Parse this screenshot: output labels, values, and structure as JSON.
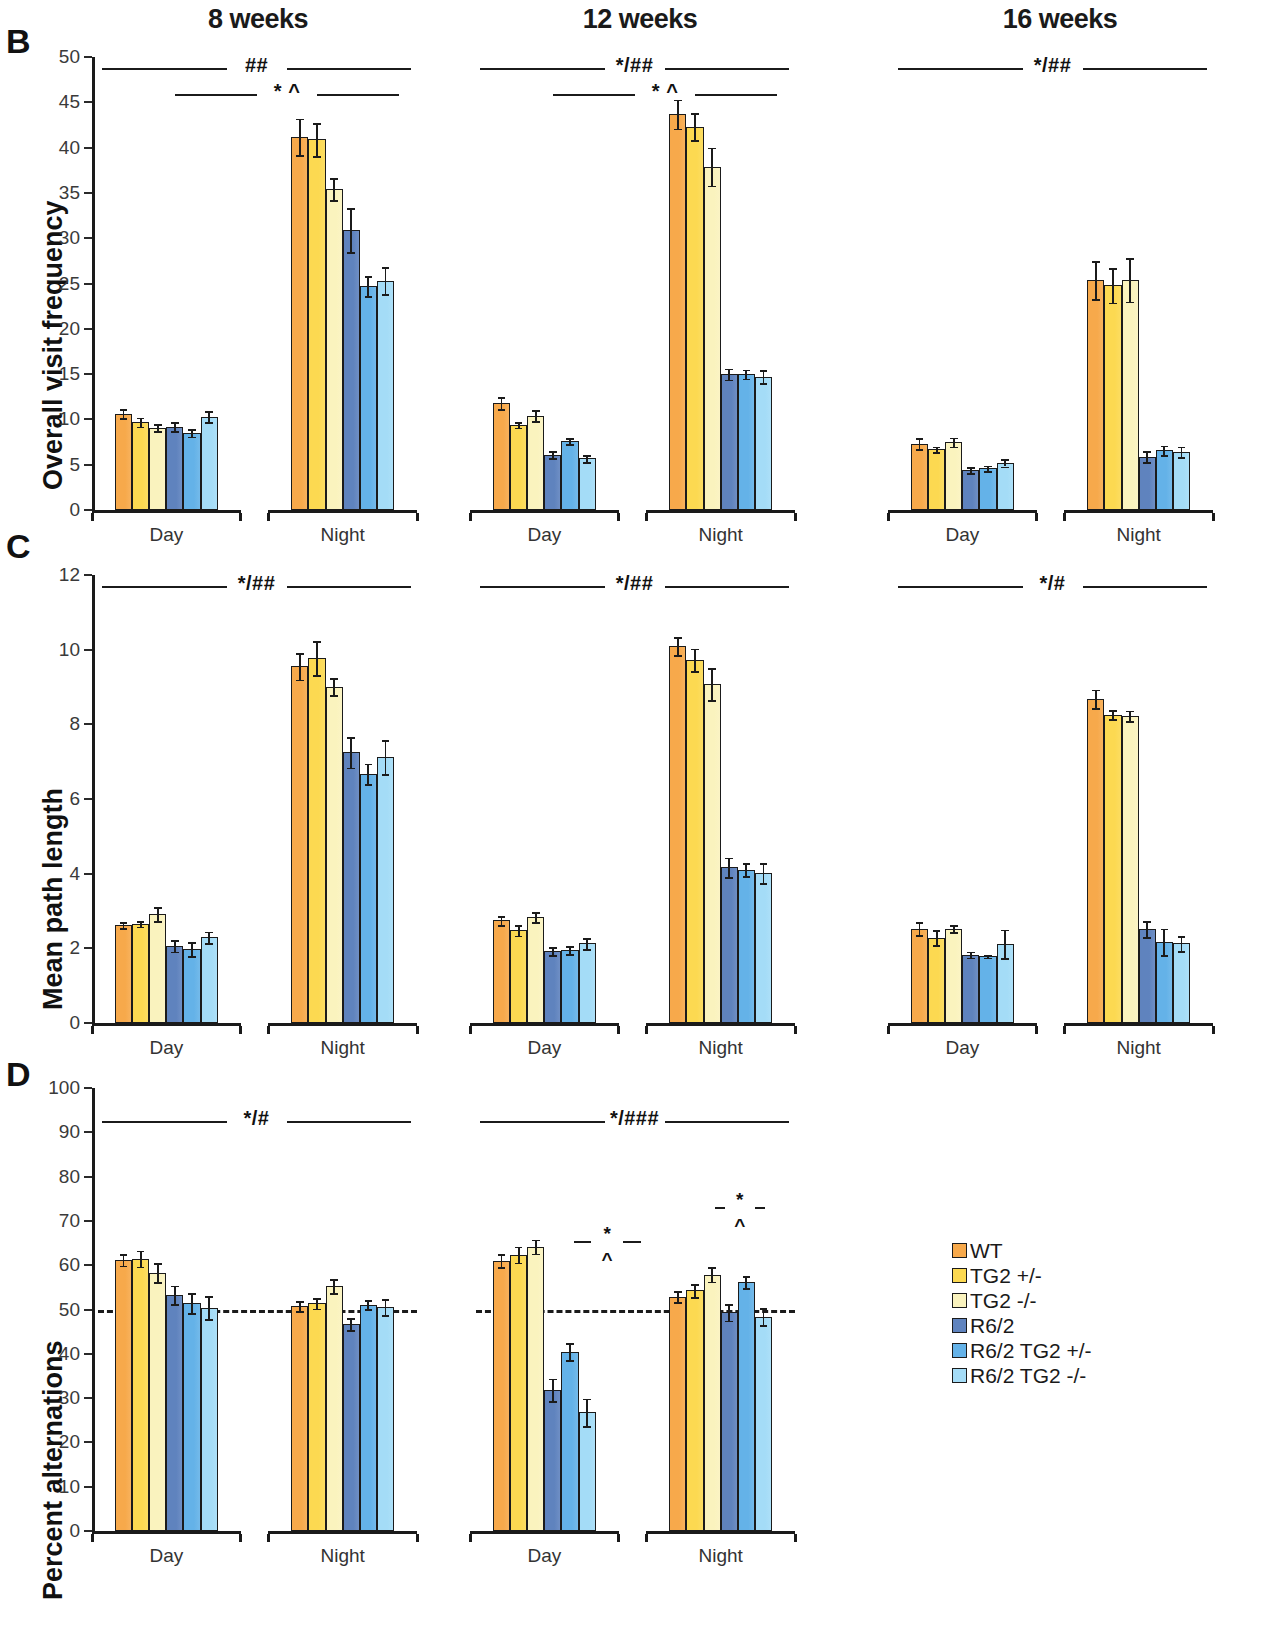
{
  "figure": {
    "column_titles": [
      "8 weeks",
      "12 weeks",
      "16 weeks"
    ],
    "panel_letters": [
      "B",
      "C",
      "D"
    ],
    "group_labels": [
      "Day",
      "Night"
    ]
  },
  "legend": {
    "position": "bottom-right",
    "entries": [
      {
        "label": "WT",
        "color": "#F7A94B"
      },
      {
        "label": "TG2 +/-",
        "color": "#FCD951"
      },
      {
        "label": "TG2 -/-",
        "color": "#FAF3BE"
      },
      {
        "label": "R6/2",
        "color": "#5F83BE"
      },
      {
        "label": "R6/2 TG2 +/-",
        "color": "#64B2E8"
      },
      {
        "label": "R6/2 TG2 -/-",
        "color": "#A4DCF7"
      }
    ]
  },
  "chart_data": [
    {
      "panel": "B",
      "type": "bar",
      "title": "8 weeks",
      "ylabel": "Overall visit frequency",
      "xlabel": "",
      "ylim": [
        0,
        50
      ],
      "yticks": [
        0,
        5,
        10,
        15,
        20,
        25,
        30,
        35,
        40,
        45,
        50
      ],
      "categories": [
        "Day",
        "Night"
      ],
      "series": [
        {
          "name": "WT",
          "values": [
            10.6,
            41.2
          ],
          "errors": [
            0.5,
            2.0
          ]
        },
        {
          "name": "TG2 +/-",
          "values": [
            9.7,
            40.9
          ],
          "errors": [
            0.5,
            1.8
          ]
        },
        {
          "name": "TG2 -/-",
          "values": [
            9.1,
            35.4
          ],
          "errors": [
            0.4,
            1.2
          ]
        },
        {
          "name": "R6/2",
          "values": [
            9.2,
            30.9
          ],
          "errors": [
            0.5,
            2.4
          ]
        },
        {
          "name": "R6/2 TG2 +/-",
          "values": [
            8.5,
            24.7
          ],
          "errors": [
            0.4,
            1.1
          ]
        },
        {
          "name": "R6/2 TG2 -/-",
          "values": [
            10.3,
            25.3
          ],
          "errors": [
            0.6,
            1.5
          ]
        }
      ],
      "annotations": [
        {
          "text": "##",
          "span": "Day-to-Night",
          "level": 1
        },
        {
          "text": "* ^",
          "span": "Night genotypes",
          "level": 2
        }
      ]
    },
    {
      "panel": "B",
      "type": "bar",
      "title": "12 weeks",
      "ylabel": "Overall visit frequency",
      "xlabel": "",
      "ylim": [
        0,
        50
      ],
      "yticks": [
        0,
        5,
        10,
        15,
        20,
        25,
        30,
        35,
        40,
        45,
        50
      ],
      "categories": [
        "Day",
        "Night"
      ],
      "series": [
        {
          "name": "WT",
          "values": [
            11.8,
            43.7
          ],
          "errors": [
            0.7,
            1.6
          ]
        },
        {
          "name": "TG2 +/-",
          "values": [
            9.4,
            42.3
          ],
          "errors": [
            0.3,
            1.5
          ]
        },
        {
          "name": "TG2 -/-",
          "values": [
            10.4,
            37.9
          ],
          "errors": [
            0.6,
            2.1
          ]
        },
        {
          "name": "R6/2",
          "values": [
            6.1,
            15.0
          ],
          "errors": [
            0.4,
            0.6
          ]
        },
        {
          "name": "R6/2 TG2 +/-",
          "values": [
            7.6,
            15.0
          ],
          "errors": [
            0.3,
            0.5
          ]
        },
        {
          "name": "R6/2 TG2 -/-",
          "values": [
            5.7,
            14.7
          ],
          "errors": [
            0.4,
            0.7
          ]
        }
      ],
      "annotations": [
        {
          "text": "*/##",
          "span": "Day-to-Night",
          "level": 1
        },
        {
          "text": "* ^",
          "span": "Night genotypes",
          "level": 2
        }
      ]
    },
    {
      "panel": "B",
      "type": "bar",
      "title": "16 weeks",
      "ylabel": "Overall visit frequency",
      "xlabel": "",
      "ylim": [
        0,
        50
      ],
      "yticks": [
        0,
        5,
        10,
        15,
        20,
        25,
        30,
        35,
        40,
        45,
        50
      ],
      "categories": [
        "Day",
        "Night"
      ],
      "series": [
        {
          "name": "WT",
          "values": [
            7.3,
            25.4
          ],
          "errors": [
            0.6,
            2.1
          ]
        },
        {
          "name": "TG2 +/-",
          "values": [
            6.7,
            24.8
          ],
          "errors": [
            0.3,
            1.9
          ]
        },
        {
          "name": "TG2 -/-",
          "values": [
            7.5,
            25.4
          ],
          "errors": [
            0.5,
            2.4
          ]
        },
        {
          "name": "R6/2",
          "values": [
            4.4,
            5.9
          ],
          "errors": [
            0.3,
            0.6
          ]
        },
        {
          "name": "R6/2 TG2 +/-",
          "values": [
            4.6,
            6.6
          ],
          "errors": [
            0.3,
            0.5
          ]
        },
        {
          "name": "R6/2 TG2 -/-",
          "values": [
            5.2,
            6.4
          ],
          "errors": [
            0.4,
            0.6
          ]
        }
      ],
      "annotations": [
        {
          "text": "*/##",
          "span": "Day-to-Night",
          "level": 1
        }
      ]
    },
    {
      "panel": "C",
      "type": "bar",
      "title": "8 weeks",
      "ylabel": "Mean path length",
      "xlabel": "",
      "ylim": [
        0,
        12
      ],
      "yticks": [
        0,
        2,
        4,
        6,
        8,
        10,
        12
      ],
      "categories": [
        "Day",
        "Night"
      ],
      "series": [
        {
          "name": "WT",
          "values": [
            2.63,
            9.55
          ],
          "errors": [
            0.08,
            0.35
          ]
        },
        {
          "name": "TG2 +/-",
          "values": [
            2.66,
            9.77
          ],
          "errors": [
            0.08,
            0.45
          ]
        },
        {
          "name": "TG2 -/-",
          "values": [
            2.92,
            9.01
          ],
          "errors": [
            0.19,
            0.22
          ]
        },
        {
          "name": "R6/2",
          "values": [
            2.06,
            7.25
          ],
          "errors": [
            0.15,
            0.41
          ]
        },
        {
          "name": "R6/2 TG2 +/-",
          "values": [
            1.98,
            6.67
          ],
          "errors": [
            0.19,
            0.28
          ]
        },
        {
          "name": "R6/2 TG2 -/-",
          "values": [
            2.3,
            7.12
          ],
          "errors": [
            0.15,
            0.46
          ]
        }
      ],
      "annotations": [
        {
          "text": "*/##",
          "span": "Day-to-Night",
          "level": 1
        }
      ]
    },
    {
      "panel": "C",
      "type": "bar",
      "title": "12 weeks",
      "ylabel": "Mean path length",
      "xlabel": "",
      "ylim": [
        0,
        12
      ],
      "yticks": [
        0,
        2,
        4,
        6,
        8,
        10,
        12
      ],
      "categories": [
        "Day",
        "Night"
      ],
      "series": [
        {
          "name": "WT",
          "values": [
            2.75,
            10.1
          ],
          "errors": [
            0.12,
            0.24
          ]
        },
        {
          "name": "TG2 +/-",
          "values": [
            2.48,
            9.73
          ],
          "errors": [
            0.14,
            0.3
          ]
        },
        {
          "name": "TG2 -/-",
          "values": [
            2.83,
            9.07
          ],
          "errors": [
            0.13,
            0.43
          ]
        },
        {
          "name": "R6/2",
          "values": [
            1.92,
            4.17
          ],
          "errors": [
            0.11,
            0.26
          ]
        },
        {
          "name": "R6/2 TG2 +/-",
          "values": [
            1.95,
            4.11
          ],
          "errors": [
            0.1,
            0.18
          ]
        },
        {
          "name": "R6/2 TG2 -/-",
          "values": [
            2.13,
            4.01
          ],
          "errors": [
            0.14,
            0.27
          ]
        }
      ],
      "annotations": [
        {
          "text": "*/##",
          "span": "Day-to-Night",
          "level": 1
        }
      ]
    },
    {
      "panel": "C",
      "type": "bar",
      "title": "16 weeks",
      "ylabel": "Mean path length",
      "xlabel": "",
      "ylim": [
        0,
        12
      ],
      "yticks": [
        0,
        2,
        4,
        6,
        8,
        10,
        12
      ],
      "categories": [
        "Day",
        "Night"
      ],
      "series": [
        {
          "name": "WT",
          "values": [
            2.53,
            8.68
          ],
          "errors": [
            0.18,
            0.25
          ]
        },
        {
          "name": "TG2 +/-",
          "values": [
            2.28,
            8.26
          ],
          "errors": [
            0.2,
            0.13
          ]
        },
        {
          "name": "TG2 -/-",
          "values": [
            2.53,
            8.23
          ],
          "errors": [
            0.1,
            0.14
          ]
        },
        {
          "name": "R6/2",
          "values": [
            1.83,
            2.52
          ],
          "errors": [
            0.08,
            0.22
          ]
        },
        {
          "name": "R6/2 TG2 +/-",
          "values": [
            1.79,
            2.17
          ],
          "errors": [
            0.04,
            0.36
          ]
        },
        {
          "name": "R6/2 TG2 -/-",
          "values": [
            2.12,
            2.13
          ],
          "errors": [
            0.38,
            0.2
          ]
        }
      ],
      "annotations": [
        {
          "text": "*/#",
          "span": "Day-to-Night",
          "level": 1
        }
      ]
    },
    {
      "panel": "D",
      "type": "bar",
      "title": "8 weeks",
      "ylabel": "Percent alternations",
      "xlabel": "",
      "ylim": [
        0,
        100
      ],
      "yticks": [
        0,
        10,
        20,
        30,
        40,
        50,
        60,
        70,
        80,
        90,
        100
      ],
      "chance_level": 50,
      "categories": [
        "Day",
        "Night"
      ],
      "series": [
        {
          "name": "WT",
          "values": [
            61.2,
            50.8
          ],
          "errors": [
            1.3,
            1.1
          ]
        },
        {
          "name": "TG2 +/-",
          "values": [
            61.5,
            51.4
          ],
          "errors": [
            1.8,
            1.2
          ]
        },
        {
          "name": "TG2 -/-",
          "values": [
            58.3,
            55.3
          ],
          "errors": [
            2.1,
            1.6
          ]
        },
        {
          "name": "R6/2",
          "values": [
            53.3,
            46.7
          ],
          "errors": [
            2.1,
            1.4
          ]
        },
        {
          "name": "R6/2 TG2 +/-",
          "values": [
            51.4,
            51.1
          ],
          "errors": [
            2.3,
            1.0
          ]
        },
        {
          "name": "R6/2 TG2 -/-",
          "values": [
            50.4,
            50.5
          ],
          "errors": [
            2.6,
            1.8
          ]
        }
      ],
      "annotations": [
        {
          "text": "*/#",
          "span": "Day-to-Night",
          "level": 1
        }
      ]
    },
    {
      "panel": "D",
      "type": "bar",
      "title": "12 weeks",
      "ylabel": "Percent alternations",
      "xlabel": "",
      "ylim": [
        0,
        100
      ],
      "yticks": [
        0,
        10,
        20,
        30,
        40,
        50,
        60,
        70,
        80,
        90,
        100
      ],
      "chance_level": 50,
      "categories": [
        "Day",
        "Night"
      ],
      "series": [
        {
          "name": "WT",
          "values": [
            61.0,
            52.9
          ],
          "errors": [
            1.5,
            1.2
          ]
        },
        {
          "name": "TG2 +/-",
          "values": [
            62.4,
            54.3
          ],
          "errors": [
            1.8,
            1.5
          ]
        },
        {
          "name": "TG2 -/-",
          "values": [
            64.2,
            57.9
          ],
          "errors": [
            1.6,
            1.6
          ]
        },
        {
          "name": "R6/2",
          "values": [
            31.9,
            49.4
          ],
          "errors": [
            2.5,
            1.9
          ]
        },
        {
          "name": "R6/2 TG2 +/-",
          "values": [
            40.5,
            56.2
          ],
          "errors": [
            2.0,
            1.4
          ]
        },
        {
          "name": "R6/2 TG2 -/-",
          "values": [
            26.8,
            48.4
          ],
          "errors": [
            3.1,
            2.0
          ]
        }
      ],
      "annotations": [
        {
          "text": "*/###",
          "span": "Day-to-Night",
          "level": 1
        },
        {
          "text": "*",
          "span": "Day genotypes",
          "level": 2
        },
        {
          "text": "^",
          "span": "Day genotypes",
          "level": 3
        },
        {
          "text": "*",
          "span": "Night genotypes",
          "level": 2
        },
        {
          "text": "^",
          "span": "Night genotypes",
          "level": 3
        }
      ]
    }
  ]
}
